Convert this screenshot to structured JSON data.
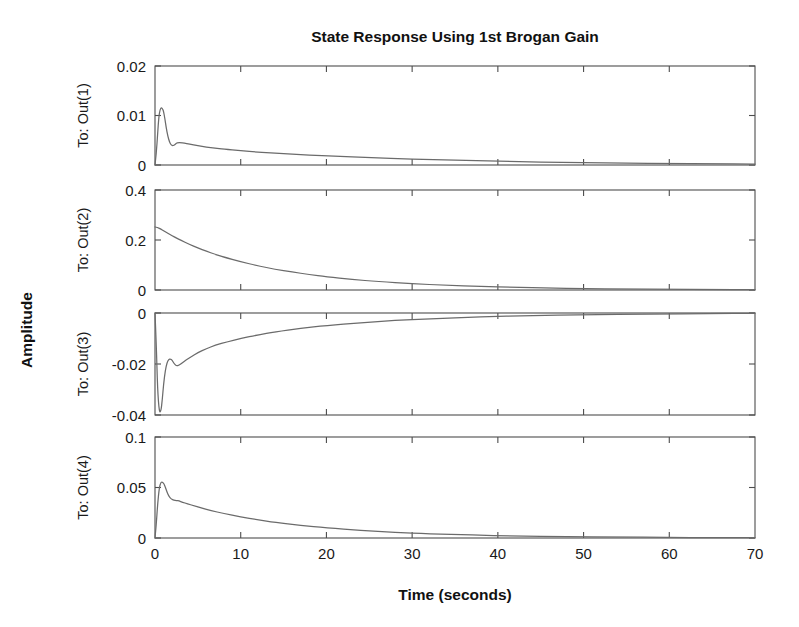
{
  "chart_data": {
    "type": "line",
    "title": "State Response Using 1st Brogan Gain",
    "xlabel": "Time (seconds)",
    "ylabel": "Amplitude",
    "grid": false,
    "legend": null,
    "xlim": [
      0,
      70
    ],
    "xticks": [
      0,
      10,
      20,
      30,
      40,
      50,
      60,
      70
    ],
    "xticklabels": [
      "0",
      "10",
      "20",
      "30",
      "40",
      "50",
      "60",
      "70"
    ],
    "line_color": "#6b6b6b",
    "subplots": [
      {
        "row_label": "To: Out(1)",
        "ylim": [
          0,
          0.02
        ],
        "yticks": [
          0,
          0.01,
          0.02
        ],
        "yticklabels": [
          "0",
          "0.01",
          "0.02"
        ],
        "x": [
          0,
          0.15,
          0.3,
          0.45,
          0.6,
          0.75,
          0.9,
          1.0,
          1.15,
          1.3,
          1.5,
          1.7,
          1.9,
          2.1,
          2.3,
          2.5,
          2.7,
          3.0,
          3.4,
          4.0,
          5.0,
          6.0,
          7.0,
          8.0,
          10.0,
          12.0,
          15.0,
          18.0,
          21.0,
          25.0,
          30.0,
          35.0,
          40.0,
          45.0,
          50.0,
          55.0,
          60.0,
          65.0,
          70.0
        ],
        "y": [
          0.0,
          0.0022,
          0.0062,
          0.0098,
          0.0113,
          0.0116,
          0.0113,
          0.0108,
          0.0094,
          0.0076,
          0.0058,
          0.0046,
          0.004,
          0.0039,
          0.0041,
          0.0044,
          0.0045,
          0.0045,
          0.0044,
          0.0042,
          0.0039,
          0.0036,
          0.0034,
          0.0032,
          0.0029,
          0.0026,
          0.0023,
          0.002,
          0.0018,
          0.0015,
          0.0012,
          0.001,
          0.0008,
          0.0006,
          0.0005,
          0.0004,
          0.0003,
          0.00025,
          0.0002
        ]
      },
      {
        "row_label": "To: Out(2)",
        "ylim": [
          0,
          0.4
        ],
        "yticks": [
          0,
          0.2,
          0.4
        ],
        "yticklabels": [
          "0",
          "0.2",
          "0.4"
        ],
        "x": [
          0,
          0.3,
          0.7,
          1.0,
          1.5,
          2.0,
          2.5,
          3.0,
          4.0,
          5.0,
          6.0,
          7.0,
          8.0,
          10.0,
          12.0,
          14.0,
          16.0,
          18.0,
          20.0,
          23.0,
          26.0,
          30.0,
          34.0,
          38.0,
          42.0,
          46.0,
          50.0,
          55.0,
          60.0,
          65.0,
          70.0
        ],
        "y": [
          0.252,
          0.25,
          0.243,
          0.237,
          0.227,
          0.217,
          0.208,
          0.199,
          0.183,
          0.168,
          0.155,
          0.143,
          0.132,
          0.113,
          0.097,
          0.083,
          0.072,
          0.062,
          0.053,
          0.042,
          0.034,
          0.025,
          0.019,
          0.014,
          0.0105,
          0.0078,
          0.0058,
          0.0038,
          0.0026,
          0.0017,
          0.0012
        ]
      },
      {
        "row_label": "To: Out(3)",
        "ylim": [
          -0.04,
          0
        ],
        "yticks": [
          -0.04,
          -0.02,
          0
        ],
        "yticklabels": [
          "-0.04",
          "-0.02",
          "0"
        ],
        "x": [
          0,
          0.15,
          0.3,
          0.5,
          0.7,
          0.85,
          1.0,
          1.2,
          1.4,
          1.6,
          1.8,
          2.0,
          2.2,
          2.5,
          2.8,
          3.2,
          3.6,
          4.2,
          5.0,
          6.0,
          7.0,
          8.5,
          10.0,
          12.0,
          14.0,
          17.0,
          20.0,
          24.0,
          28.0,
          32.0,
          38.0,
          44.0,
          50.0,
          58.0,
          65.0,
          70.0
        ],
        "y": [
          0.0,
          -0.012,
          -0.03,
          -0.039,
          -0.0385,
          -0.034,
          -0.028,
          -0.0225,
          -0.0195,
          -0.0182,
          -0.018,
          -0.0185,
          -0.0197,
          -0.0208,
          -0.0205,
          -0.0195,
          -0.0185,
          -0.0172,
          -0.0155,
          -0.014,
          -0.0127,
          -0.0112,
          -0.01,
          -0.0086,
          -0.0074,
          -0.006,
          -0.0049,
          -0.0038,
          -0.0029,
          -0.0023,
          -0.0015,
          -0.001,
          -0.0007,
          -0.0004,
          -0.0002,
          -0.0001
        ]
      },
      {
        "row_label": "To: Out(4)",
        "ylim": [
          0,
          0.1
        ],
        "yticks": [
          0,
          0.05,
          0.1
        ],
        "yticklabels": [
          "0",
          "0.05",
          "0.1"
        ],
        "x": [
          0,
          0.15,
          0.3,
          0.5,
          0.7,
          0.9,
          1.05,
          1.2,
          1.4,
          1.6,
          1.9,
          2.2,
          2.5,
          2.8,
          3.2,
          3.8,
          4.5,
          5.5,
          6.5,
          8.0,
          10.0,
          12.0,
          14.0,
          17.0,
          20.0,
          24.0,
          28.0,
          32.0,
          37.0,
          42.0,
          48.0,
          54.0,
          60.0,
          65.0,
          70.0
        ],
        "y": [
          0.0,
          0.013,
          0.033,
          0.05,
          0.0555,
          0.055,
          0.0535,
          0.0505,
          0.0455,
          0.0415,
          0.0385,
          0.0375,
          0.0372,
          0.0366,
          0.0355,
          0.0338,
          0.032,
          0.0295,
          0.0272,
          0.0243,
          0.0208,
          0.018,
          0.0155,
          0.0124,
          0.01,
          0.0075,
          0.0056,
          0.0042,
          0.0029,
          0.002,
          0.0013,
          0.0009,
          0.0006,
          0.0004,
          0.0003
        ]
      }
    ]
  },
  "figure": {
    "plot_left": 155,
    "plot_right": 755,
    "panel_tops": [
      66,
      190,
      313,
      437
    ],
    "panel_bottoms": [
      165,
      290,
      415,
      538
    ]
  }
}
